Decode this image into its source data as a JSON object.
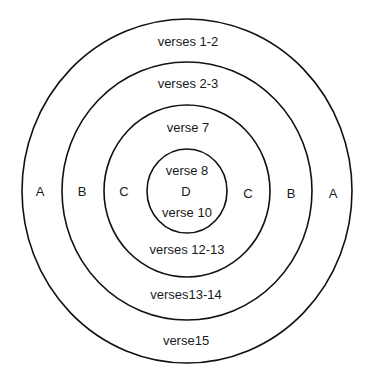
{
  "diagram": {
    "type": "concentric-chiasm",
    "rings": [
      {
        "id": "A",
        "letter": "A",
        "top": "verses 1-2",
        "bottom": "verse15"
      },
      {
        "id": "B",
        "letter": "B",
        "top": "verses 2-3",
        "bottom": "verses13-14"
      },
      {
        "id": "C",
        "letter": "C",
        "top": "verse 7",
        "bottom": "verses 12-13"
      },
      {
        "id": "D",
        "letter": "D",
        "top": "verse 8",
        "bottom": "verse 10"
      }
    ],
    "stroke_color": "#111111",
    "background": "#ffffff"
  }
}
